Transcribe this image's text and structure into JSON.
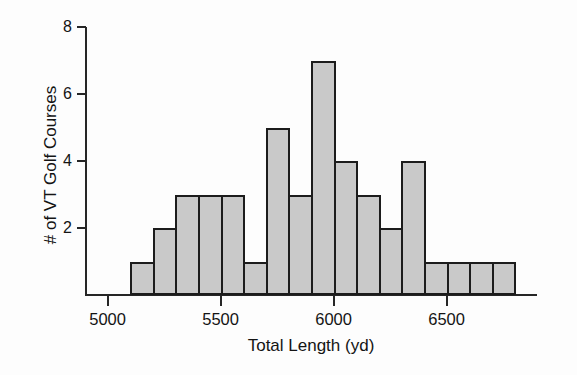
{
  "chart_data": {
    "type": "bar",
    "title": "",
    "subtitle": "",
    "xlabel": "Total Length (yd)",
    "ylabel": "# of VT Golf Courses",
    "grid": false,
    "legend": "none",
    "bin_width": 100,
    "bin_edges": [
      5100,
      5200,
      5300,
      5400,
      5500,
      5600,
      5700,
      5800,
      5900,
      6000,
      6100,
      6200,
      6300,
      6400,
      6500,
      6600,
      6700,
      6800
    ],
    "categories": [
      "5100-5200",
      "5200-5300",
      "5300-5400",
      "5400-5500",
      "5500-5600",
      "5600-5700",
      "5700-5800",
      "5800-5900",
      "5900-6000",
      "6000-6100",
      "6100-6200",
      "6200-6300",
      "6300-6400",
      "6400-6500",
      "6500-6600",
      "6600-6700",
      "6700-6800"
    ],
    "values": [
      1,
      2,
      3,
      3,
      3,
      1,
      5,
      3,
      7,
      4,
      3,
      2,
      4,
      1,
      1,
      1,
      1
    ],
    "total_count": 45,
    "xlim": [
      4900,
      6900
    ],
    "ylim": [
      0,
      8
    ],
    "x_ticks": [
      5000,
      5500,
      6000,
      6500
    ],
    "x_tick_labels": [
      "5000",
      "5500",
      "6000",
      "6500"
    ],
    "y_ticks": [
      2,
      4,
      6,
      8
    ],
    "y_tick_labels": [
      "2",
      "4",
      "6",
      "8"
    ],
    "bar_fill_color": "#c9c9c9",
    "bar_edge_color": "#1c1c1c",
    "axis_color": "#262626",
    "background_color": "#fdfdfd"
  }
}
